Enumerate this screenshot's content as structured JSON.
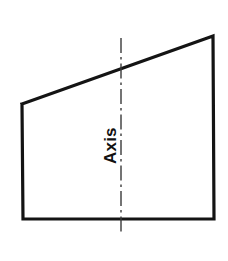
{
  "figure": {
    "name": "axis-of-revolution-diagram",
    "canvas": {
      "width": 228,
      "height": 261,
      "background": "#ffffff"
    },
    "colors": {
      "outline": "#141414",
      "centerline": "#3a3a3a",
      "label": "#111111",
      "background": "#ffffff"
    },
    "shape": {
      "type": "quadrilateral",
      "description": "trapezoid with slanted top edge rising left to right",
      "stroke_width": 3.2,
      "fill": "none",
      "vertices": [
        {
          "name": "top-left",
          "x": 22,
          "y": 104
        },
        {
          "name": "top-right",
          "x": 213,
          "y": 36
        },
        {
          "name": "bottom-right",
          "x": 214,
          "y": 219
        },
        {
          "name": "bottom-left",
          "x": 23,
          "y": 219
        }
      ],
      "points_attr": "22,104 213,36 214,219 23,219 22,104"
    },
    "centerline": {
      "name": "axis-centerline",
      "orientation": "vertical",
      "x": 121,
      "y_start": 38,
      "y_end": 233,
      "stroke_width": 1.4,
      "style": "dash-dot",
      "dash_pattern": "15 4 2.5 4"
    },
    "label": {
      "text": "Axis",
      "rotation_degrees": -90,
      "x": 116,
      "y": 164,
      "anchor": "start"
    }
  }
}
